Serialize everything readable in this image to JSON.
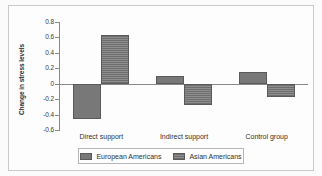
{
  "chart_data": {
    "type": "bar",
    "title": "",
    "xlabel": "",
    "ylabel": "Change in stress levels",
    "categories": [
      "Direct support",
      "Indirect support",
      "Control group"
    ],
    "series": [
      {
        "name": "European Americans",
        "values": [
          -0.46,
          0.1,
          0.15
        ],
        "swatch": "solid-gray"
      },
      {
        "name": "Asian Americans",
        "values": [
          0.63,
          -0.27,
          -0.17
        ],
        "swatch": "hatched-gray"
      }
    ],
    "ylim": [
      -0.6,
      0.8
    ],
    "ytick_step": 0.2,
    "yticks": [
      "0.8",
      "0.6",
      "0.4",
      "0.2",
      "0",
      "-0.2",
      "-0.4",
      "-0.6"
    ],
    "ytick_values": [
      0.8,
      0.6,
      0.4,
      0.2,
      0,
      -0.2,
      -0.4,
      -0.6
    ],
    "grid": false,
    "legend_position": "bottom-center",
    "colors": {
      "series_1": "#787878",
      "series_2": "#7b7b7b",
      "axis": "#8a8a8a",
      "frame": "#c9c9c9",
      "background": "#fdfdfd",
      "text": "#2f2f2f"
    }
  },
  "legend": {
    "items": [
      {
        "label": "European Americans"
      },
      {
        "label": "Asian Americans"
      }
    ]
  },
  "axis": {
    "y_title": "Change in stress levels"
  }
}
